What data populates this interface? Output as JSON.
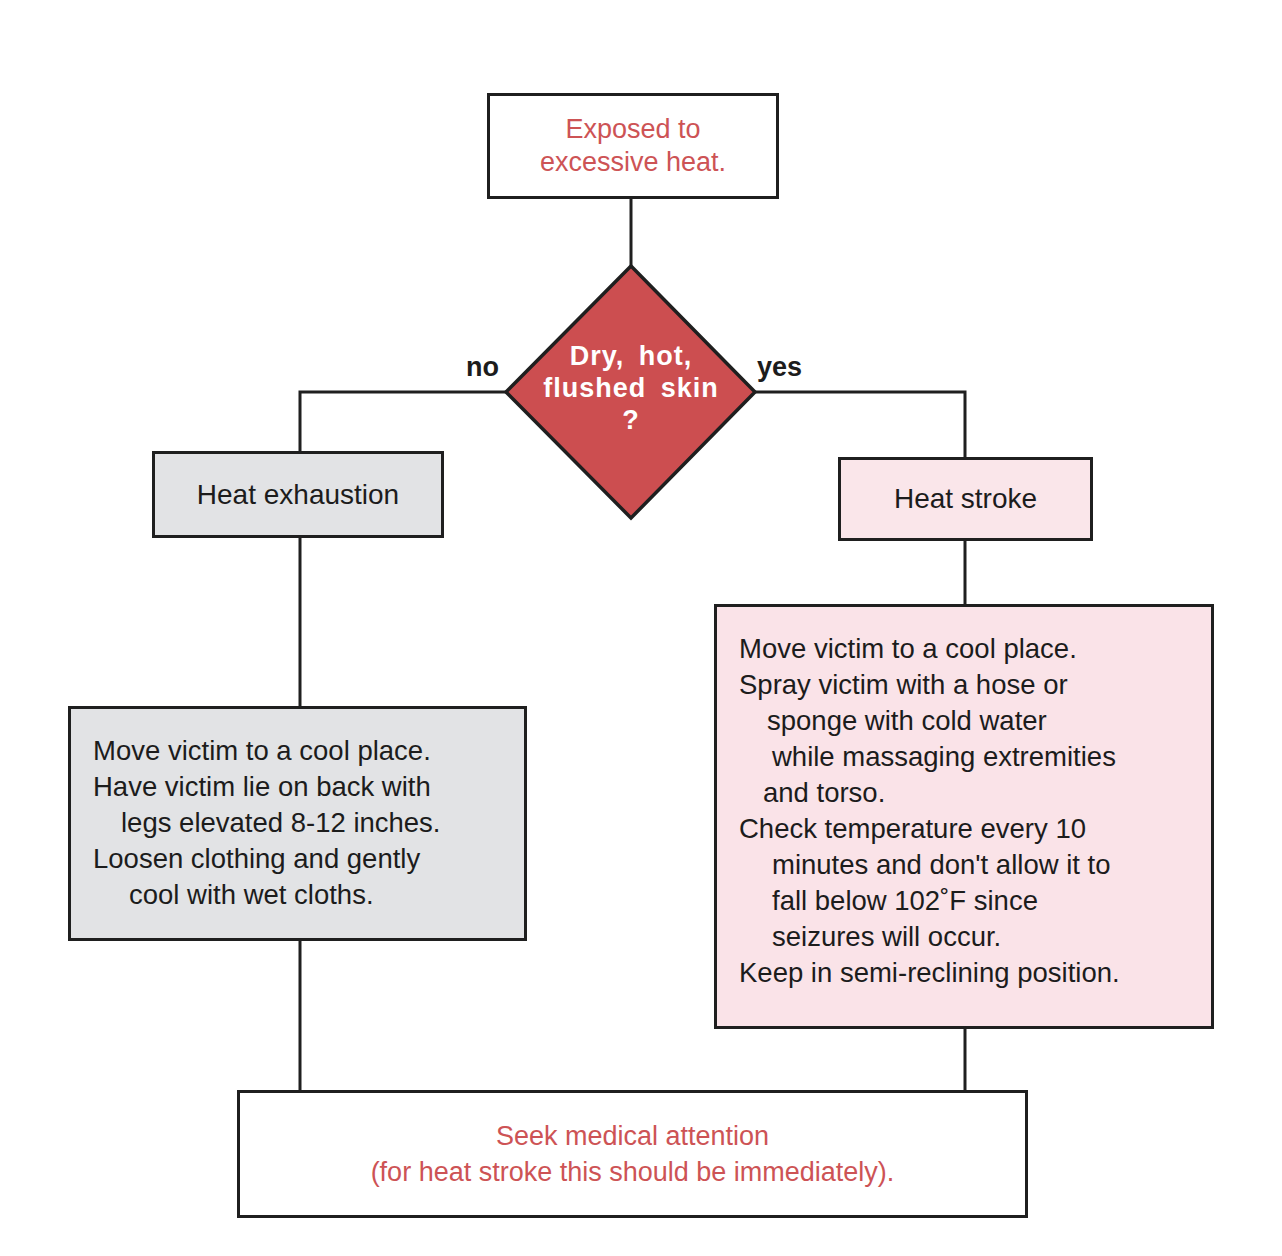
{
  "colors": {
    "line": "#1f1f1f",
    "terminal_text": "#cd5355",
    "decision_fill": "#cc4e50",
    "exhaustion_fill": "#e2e3e5",
    "stroke_fill": "#fae6ea"
  },
  "start": {
    "lines": [
      "Exposed to",
      "excessive heat."
    ]
  },
  "decision": {
    "lines": [
      "Dry, hot,",
      "flushed skin",
      "?"
    ],
    "no_label": "no",
    "yes_label": "yes"
  },
  "heat_exhaustion": {
    "title": "Heat exhaustion",
    "steps": [
      "Move victim to a cool place.",
      "Have victim lie on back with",
      "legs elevated 8-12 inches.",
      "Loosen clothing and gently",
      "cool with wet cloths."
    ]
  },
  "heat_stroke": {
    "title": "Heat stroke",
    "steps": [
      "Move victim to a cool place.",
      "Spray victim with a hose or",
      "sponge with cold water",
      "while massaging extremities",
      "and torso.",
      "Check temperature every 10",
      "minutes and don't allow it to",
      "fall below 102˚F since",
      "seizures will occur.",
      "Keep in semi-reclining position."
    ]
  },
  "end": {
    "lines": [
      "Seek medical attention",
      "(for heat stroke this should be immediately)."
    ]
  }
}
